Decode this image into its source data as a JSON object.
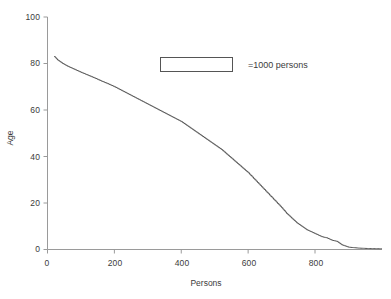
{
  "chart_data": {
    "type": "line",
    "title": "",
    "xlabel": "Persons",
    "ylabel": "Age",
    "xlim": [
      0,
      1000
    ],
    "ylim": [
      0,
      100
    ],
    "xticks": [
      0,
      200,
      400,
      600,
      800
    ],
    "yticks": [
      0,
      20,
      40,
      60,
      80,
      100
    ],
    "xtick_labels": [
      "0",
      "200",
      "400",
      "600",
      "800"
    ],
    "ytick_labels": [
      "0",
      "20",
      "40",
      "60",
      "80",
      "100"
    ],
    "grid": false,
    "legend": {
      "position": "upper-center",
      "swatch": "rectangle-outline",
      "label": "=1000 persons"
    },
    "series": [
      {
        "name": "age-by-person-rank",
        "style": "step",
        "color": "#555555",
        "x": [
          20,
          30,
          45,
          60,
          80,
          100,
          120,
          140,
          160,
          180,
          200,
          220,
          240,
          260,
          280,
          300,
          320,
          340,
          360,
          380,
          400,
          420,
          440,
          460,
          480,
          500,
          520,
          540,
          560,
          580,
          600,
          620,
          640,
          660,
          680,
          700,
          715,
          730,
          745,
          760,
          775,
          790,
          805,
          820,
          835,
          850,
          865,
          880,
          900,
          930,
          960,
          1000
        ],
        "y": [
          83,
          81.5,
          80,
          78.8,
          77.5,
          76.2,
          75,
          73.8,
          72.5,
          71.3,
          70,
          68.5,
          67,
          65.5,
          64,
          62.5,
          61,
          59.5,
          58,
          56.5,
          55,
          53,
          51,
          49,
          47,
          45,
          43,
          40.5,
          38,
          35.5,
          33,
          30,
          27,
          24,
          21,
          18,
          15.5,
          13.5,
          11.5,
          10,
          8.5,
          7.5,
          6.5,
          5.5,
          5,
          4,
          3.5,
          2,
          1,
          0.6,
          0.4,
          0.3
        ]
      }
    ]
  }
}
